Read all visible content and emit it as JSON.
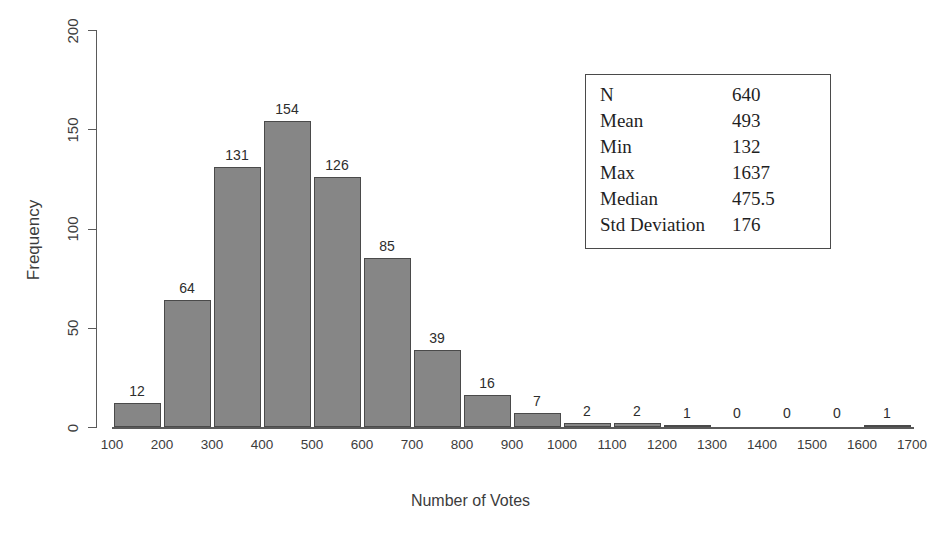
{
  "chart_data": {
    "type": "bar",
    "title": "",
    "xlabel": "Number of Votes",
    "ylabel": "Frequency",
    "xlim": [
      100,
      1700
    ],
    "ylim": [
      0,
      200
    ],
    "xticks": [
      100,
      200,
      300,
      400,
      500,
      600,
      700,
      800,
      900,
      1000,
      1100,
      1200,
      1300,
      1400,
      1500,
      1600,
      1700
    ],
    "yticks": [
      0,
      50,
      100,
      150,
      200
    ],
    "grid": false,
    "legend": false,
    "bin_width": 100,
    "bin_starts": [
      100,
      200,
      300,
      400,
      500,
      600,
      700,
      800,
      900,
      1000,
      1100,
      1200,
      1300,
      1400,
      1500,
      1600
    ],
    "categories": [
      "100-200",
      "200-300",
      "300-400",
      "400-500",
      "500-600",
      "600-700",
      "700-800",
      "800-900",
      "900-1000",
      "1000-1100",
      "1100-1200",
      "1200-1300",
      "1300-1400",
      "1400-1500",
      "1500-1600",
      "1600-1700"
    ],
    "values": [
      12,
      64,
      131,
      154,
      126,
      85,
      39,
      16,
      7,
      2,
      2,
      1,
      0,
      0,
      0,
      1
    ],
    "bar_labels": [
      "12",
      "64",
      "131",
      "154",
      "126",
      "85",
      "39",
      "16",
      "7",
      "2",
      "2",
      "1",
      "0",
      "0",
      "0",
      "1"
    ],
    "bar_color": "#868686",
    "bar_edge_color": "#4a4a4a",
    "axis_color": "#5a5a5a"
  },
  "stats": {
    "rows": [
      {
        "label": "N",
        "value": "640"
      },
      {
        "label": "Mean",
        "value": "493"
      },
      {
        "label": "Min",
        "value": "132"
      },
      {
        "label": "Max",
        "value": "1637"
      },
      {
        "label": "Median",
        "value": "475.5"
      },
      {
        "label": "Std Deviation",
        "value": "176"
      }
    ]
  }
}
